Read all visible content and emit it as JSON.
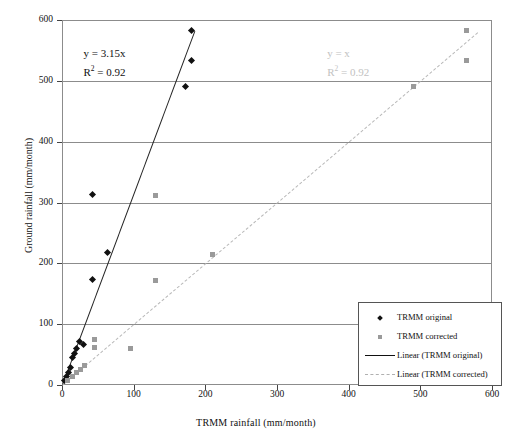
{
  "chart_data": {
    "type": "scatter",
    "title": "",
    "xlabel": "TRMM rainfall (mm/month)",
    "ylabel": "Ground rainfall (mm/month)",
    "xlim": [
      0,
      600
    ],
    "ylim": [
      0,
      600
    ],
    "xticks": [
      0,
      100,
      200,
      300,
      400,
      500,
      600
    ],
    "yticks": [
      0,
      100,
      200,
      300,
      400,
      500,
      600
    ],
    "grid": "horizontal",
    "legend_position": "bottom-right",
    "series": [
      {
        "name": "TRMM original",
        "marker": "diamond",
        "color": "#111111",
        "points": [
          [
            3,
            8
          ],
          [
            6,
            14
          ],
          [
            9,
            20
          ],
          [
            12,
            28
          ],
          [
            14,
            45
          ],
          [
            17,
            52
          ],
          [
            20,
            60
          ],
          [
            24,
            72
          ],
          [
            30,
            66
          ],
          [
            42,
            173
          ],
          [
            42,
            313
          ],
          [
            63,
            218
          ],
          [
            173,
            490
          ],
          [
            180,
            533
          ],
          [
            180,
            583
          ]
        ]
      },
      {
        "name": "TRMM corrected",
        "marker": "square",
        "color": "#9a9a9a",
        "points": [
          [
            8,
            8
          ],
          [
            14,
            14
          ],
          [
            20,
            20
          ],
          [
            26,
            26
          ],
          [
            32,
            32
          ],
          [
            45,
            62
          ],
          [
            45,
            75
          ],
          [
            95,
            60
          ],
          [
            130,
            172
          ],
          [
            130,
            312
          ],
          [
            210,
            215
          ],
          [
            490,
            490
          ],
          [
            565,
            533
          ],
          [
            565,
            583
          ]
        ]
      }
    ],
    "fits": [
      {
        "name": "Linear (TRMM original)",
        "style": "solid",
        "color": "#222222",
        "equation": "y = 3.15x",
        "r2_label": "R",
        "r2_exp": "2",
        "r2_value": " = 0.92",
        "x_range": [
          0,
          185
        ],
        "slope": 3.15,
        "intercept": 0
      },
      {
        "name": "Linear (TRMM corrected)",
        "style": "dash-dot",
        "color": "#b9b9b9",
        "equation": "y = x",
        "r2_label": "R",
        "r2_exp": "2",
        "r2_value": " = 0.92",
        "x_range": [
          0,
          580
        ],
        "slope": 1.0,
        "intercept": 0
      }
    ],
    "annotations": [
      {
        "text": "y = 3.15x",
        "x": 30,
        "y": 545,
        "color": "#111111"
      },
      {
        "text": "y = x",
        "x": 370,
        "y": 545,
        "color": "#c2c2c2"
      }
    ]
  },
  "legend": {
    "items": [
      {
        "label": "TRMM original",
        "key": "diamond-marker"
      },
      {
        "label": "TRMM corrected",
        "key": "square-marker"
      },
      {
        "label": "Linear (TRMM original)",
        "key": "solid-line"
      },
      {
        "label": "Linear (TRMM corrected)",
        "key": "dash-dot-line"
      }
    ]
  }
}
